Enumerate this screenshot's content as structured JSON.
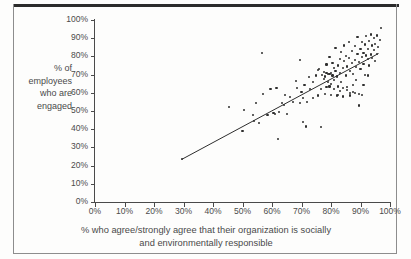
{
  "figure": {
    "clipped_caption_above_rule": "",
    "border_color": "#8d8d8d",
    "rule_color": "#2b2b2b"
  },
  "axes": {
    "y_title_lines": [
      "% of",
      "employees",
      "who are",
      "engaged"
    ],
    "x_title_lines": [
      "% who agree/strongly agree that their organization is socially",
      "and environmentally responsible"
    ],
    "y_ticks": [
      "0%",
      "10%",
      "20%",
      "30%",
      "40%",
      "50%",
      "60%",
      "70%",
      "80%",
      "90%",
      "100%"
    ],
    "x_ticks": [
      "0%",
      "10%",
      "20%",
      "30%",
      "40%",
      "50%",
      "60%",
      "70%",
      "80%",
      "90%",
      "100%"
    ]
  },
  "chart_data": {
    "type": "scatter",
    "title": "",
    "subtitle": "",
    "xlabel": "% who agree/strongly agree that their organization is socially and environmentally responsible",
    "ylabel": "% of employees who are engaged",
    "xlim": [
      0,
      100
    ],
    "ylim": [
      0,
      100
    ],
    "xtick_step": 10,
    "ytick_step": 10,
    "grid": false,
    "legend": false,
    "marker_color": "#2e2e2e",
    "marker_size_px": 2.2,
    "trendline": {
      "type": "linear",
      "color": "#2e2e2e",
      "width_px": 1,
      "x_start": 29.5,
      "y_start": 23.5,
      "x_end": 96.0,
      "y_end": 81.5
    },
    "points": [
      [
        29.5,
        23.5
      ],
      [
        45.5,
        52.0
      ],
      [
        50.0,
        39.0
      ],
      [
        50.5,
        50.5
      ],
      [
        53.5,
        48.0
      ],
      [
        54.0,
        44.5
      ],
      [
        54.5,
        54.5
      ],
      [
        55.5,
        43.5
      ],
      [
        56.5,
        82.0
      ],
      [
        57.0,
        59.5
      ],
      [
        58.5,
        48.0
      ],
      [
        59.5,
        62.0
      ],
      [
        60.5,
        49.0
      ],
      [
        61.0,
        48.5
      ],
      [
        61.5,
        62.5
      ],
      [
        62.0,
        34.8
      ],
      [
        62.5,
        49.5
      ],
      [
        63.5,
        54.5
      ],
      [
        64.0,
        53.5
      ],
      [
        64.5,
        59.0
      ],
      [
        65.0,
        48.5
      ],
      [
        66.0,
        57.5
      ],
      [
        67.0,
        55.0
      ],
      [
        68.0,
        66.5
      ],
      [
        68.5,
        62.5
      ],
      [
        69.5,
        78.0
      ],
      [
        69.5,
        54.5
      ],
      [
        70.0,
        60.5
      ],
      [
        70.5,
        57.0
      ],
      [
        70.5,
        44.0
      ],
      [
        71.0,
        64.5
      ],
      [
        71.5,
        41.5
      ],
      [
        72.0,
        55.0
      ],
      [
        72.5,
        68.5
      ],
      [
        73.0,
        62.0
      ],
      [
        74.0,
        66.0
      ],
      [
        75.0,
        69.5
      ],
      [
        75.5,
        72.5
      ],
      [
        76.0,
        73.0
      ],
      [
        76.5,
        41.0
      ],
      [
        77.0,
        70.0
      ],
      [
        77.5,
        67.5
      ],
      [
        77.5,
        71.5
      ],
      [
        78.0,
        69.0
      ],
      [
        78.0,
        59.5
      ],
      [
        78.5,
        71.0
      ],
      [
        78.5,
        75.5
      ],
      [
        79.0,
        70.5
      ],
      [
        79.0,
        66.0
      ],
      [
        79.5,
        70.5
      ],
      [
        79.5,
        79.5
      ],
      [
        80.0,
        71.0
      ],
      [
        80.0,
        65.0
      ],
      [
        80.5,
        69.5
      ],
      [
        80.5,
        76.5
      ],
      [
        81.0,
        73.5
      ],
      [
        81.0,
        67.0
      ],
      [
        81.5,
        72.0
      ],
      [
        81.5,
        84.5
      ],
      [
        82.0,
        58.5
      ],
      [
        82.0,
        69.0
      ],
      [
        82.5,
        75.0
      ],
      [
        82.5,
        63.5
      ],
      [
        83.0,
        78.5
      ],
      [
        83.0,
        71.0
      ],
      [
        83.5,
        66.0
      ],
      [
        83.5,
        82.5
      ],
      [
        84.0,
        73.5
      ],
      [
        84.0,
        62.5
      ],
      [
        84.5,
        77.5
      ],
      [
        84.5,
        86.0
      ],
      [
        85.0,
        69.5
      ],
      [
        85.0,
        80.0
      ],
      [
        85.5,
        74.5
      ],
      [
        85.5,
        63.0
      ],
      [
        86.0,
        88.0
      ],
      [
        86.0,
        79.0
      ],
      [
        86.5,
        72.0
      ],
      [
        86.5,
        60.0
      ],
      [
        87.0,
        83.0
      ],
      [
        87.0,
        76.5
      ],
      [
        87.5,
        70.5
      ],
      [
        87.5,
        60.5
      ],
      [
        88.0,
        85.5
      ],
      [
        88.0,
        78.0
      ],
      [
        88.5,
        74.0
      ],
      [
        88.5,
        67.0
      ],
      [
        89.0,
        81.5
      ],
      [
        89.0,
        90.5
      ],
      [
        89.5,
        77.0
      ],
      [
        89.5,
        59.5
      ],
      [
        90.0,
        84.0
      ],
      [
        90.0,
        73.0
      ],
      [
        90.5,
        79.5
      ],
      [
        90.5,
        88.0
      ],
      [
        91.0,
        82.0
      ],
      [
        91.0,
        76.0
      ],
      [
        91.5,
        86.5
      ],
      [
        91.5,
        70.0
      ],
      [
        92.0,
        80.5
      ],
      [
        92.0,
        91.0
      ],
      [
        92.5,
        78.5
      ],
      [
        92.5,
        84.0
      ],
      [
        93.0,
        75.0
      ],
      [
        93.0,
        88.5
      ],
      [
        93.5,
        81.0
      ],
      [
        93.5,
        92.0
      ],
      [
        94.0,
        79.0
      ],
      [
        94.0,
        86.0
      ],
      [
        94.5,
        83.5
      ],
      [
        94.5,
        90.0
      ],
      [
        95.0,
        77.5
      ],
      [
        95.0,
        87.0
      ],
      [
        95.5,
        81.5
      ],
      [
        95.5,
        91.5
      ],
      [
        96.0,
        85.0
      ],
      [
        96.5,
        89.0
      ],
      [
        97.0,
        95.5
      ],
      [
        89.5,
        53.0
      ],
      [
        90.5,
        59.0
      ],
      [
        86.5,
        58.5
      ],
      [
        88.0,
        60.0
      ],
      [
        84.0,
        58.0
      ],
      [
        82.5,
        59.0
      ],
      [
        80.0,
        59.0
      ],
      [
        75.5,
        58.5
      ],
      [
        74.0,
        57.0
      ],
      [
        76.5,
        62.0
      ],
      [
        81.0,
        62.0
      ],
      [
        79.5,
        63.5
      ],
      [
        83.0,
        61.0
      ],
      [
        85.5,
        61.5
      ],
      [
        78.5,
        63.0
      ],
      [
        87.5,
        64.5
      ],
      [
        91.0,
        64.5
      ],
      [
        92.5,
        69.5
      ]
    ]
  }
}
